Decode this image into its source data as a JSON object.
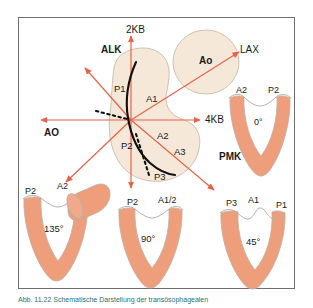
{
  "figure": {
    "type": "anatomical-diagram",
    "caption": "Abb. 11.22  Schematische Darstellung der transösophagealen"
  },
  "colors": {
    "arrow": "#e8624a",
    "leaflet_fill": "#ef9e7c",
    "leaflet_outline": "#b9b1a6",
    "annulus_fill": "#f5e8d8",
    "annulus_outline": "#c9bba8",
    "aorta_fill": "#f5e8d8",
    "coaptation_line": "#101010",
    "frame_border": "#6e6e6e",
    "caption_text": "#2f6f6f"
  },
  "plane_labels": [
    {
      "id": "two-chamber",
      "text": "2KB",
      "x": 126,
      "y": 25,
      "bold": false
    },
    {
      "id": "four-chamber",
      "text": "4KB",
      "x": 205,
      "y": 115,
      "bold": false
    },
    {
      "id": "long-axis",
      "text": "LAX",
      "x": 240,
      "y": 45,
      "bold": false
    },
    {
      "id": "aorta-left",
      "text": "AO",
      "x": 44,
      "y": 128,
      "bold": true
    }
  ],
  "commissure_labels": [
    {
      "id": "alk",
      "text": "ALK",
      "x": 101,
      "y": 45,
      "bold": true
    },
    {
      "id": "pmk",
      "text": "PMK",
      "x": 219,
      "y": 152,
      "bold": true
    }
  ],
  "aorta": {
    "label": "Ao",
    "x": 206,
    "y": 56
  },
  "segments": [
    {
      "id": "p1",
      "text": "P1",
      "x": 114,
      "y": 84
    },
    {
      "id": "a1",
      "text": "A1",
      "x": 146,
      "y": 94
    },
    {
      "id": "p2",
      "text": "P2",
      "x": 121,
      "y": 141
    },
    {
      "id": "a2",
      "text": "A2",
      "x": 157,
      "y": 131
    },
    {
      "id": "a3",
      "text": "A3",
      "x": 174,
      "y": 147
    },
    {
      "id": "p3",
      "text": "P3",
      "x": 154,
      "y": 172
    }
  ],
  "valve_views": [
    {
      "id": "view-0",
      "angle": "0°",
      "angle_x": 258,
      "angle_y": 124,
      "leaflet_labels": [
        {
          "text": "A2",
          "x": 238,
          "y": 92
        },
        {
          "text": "P2",
          "x": 272,
          "y": 92
        }
      ]
    },
    {
      "id": "view-135",
      "angle": "135°",
      "angle_x": 56,
      "angle_y": 230,
      "leaflet_labels": [
        {
          "text": "P2",
          "x": 27,
          "y": 193
        },
        {
          "text": "A2",
          "x": 60,
          "y": 188
        }
      ],
      "has_aorta_cylinder": true
    },
    {
      "id": "view-90",
      "angle": "90°",
      "angle_x": 150,
      "angle_y": 240,
      "leaflet_labels": [
        {
          "text": "P2",
          "x": 130,
          "y": 204
        },
        {
          "text": "A1/2",
          "x": 163,
          "y": 202
        }
      ]
    },
    {
      "id": "view-45",
      "angle": "45°",
      "angle_x": 253,
      "angle_y": 243,
      "leaflet_labels": [
        {
          "text": "P3",
          "x": 228,
          "y": 205
        },
        {
          "text": "A1",
          "x": 252,
          "y": 202
        },
        {
          "text": "P1",
          "x": 282,
          "y": 207
        }
      ]
    }
  ]
}
